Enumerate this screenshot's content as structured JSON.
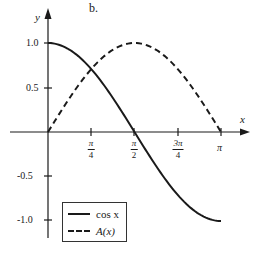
{
  "panel_label": "b.",
  "axes": {
    "x_label": "x",
    "y_label": "y",
    "y_ticks": [
      "1.0",
      "0.5",
      "-0.5",
      "-1.0"
    ],
    "x_ticks": [
      {
        "num": "π",
        "den": "4"
      },
      {
        "num": "π",
        "den": "2"
      },
      {
        "num": "3π",
        "den": "4"
      },
      {
        "num": "π",
        "den": ""
      }
    ]
  },
  "legend": {
    "items": [
      {
        "label": "cos x",
        "style": "solid"
      },
      {
        "label": "A(x)",
        "style": "dashed"
      }
    ]
  },
  "chart_data": {
    "type": "line",
    "title": "b.",
    "xlabel": "x",
    "ylabel": "y",
    "xlim": [
      0,
      3.14159
    ],
    "ylim": [
      -1.0,
      1.0
    ],
    "x_tick_labels": [
      "π/4",
      "π/2",
      "3π/4",
      "π"
    ],
    "x_tick_values": [
      0.7854,
      1.5708,
      2.3562,
      3.1416
    ],
    "y_tick_labels": [
      "1.0",
      "0.5",
      "-0.5",
      "-1.0"
    ],
    "y_tick_values": [
      1.0,
      0.5,
      -0.5,
      -1.0
    ],
    "grid": false,
    "legend_position": "lower left",
    "x": [
      0,
      0.3927,
      0.7854,
      1.1781,
      1.5708,
      1.9635,
      2.3562,
      2.7489,
      3.1416
    ],
    "series": [
      {
        "name": "cos x",
        "style": "solid",
        "values": [
          1.0,
          0.924,
          0.707,
          0.383,
          0.0,
          -0.383,
          -0.707,
          -0.924,
          -1.0
        ]
      },
      {
        "name": "A(x)",
        "style": "dashed",
        "values": [
          0.0,
          0.383,
          0.707,
          0.924,
          1.0,
          0.924,
          0.707,
          0.383,
          0.0
        ]
      }
    ]
  }
}
